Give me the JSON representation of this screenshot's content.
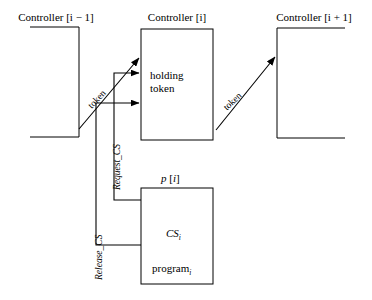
{
  "figure": {
    "background": "#ffffff",
    "stroke": "#000000"
  },
  "controllers": [
    {
      "id": "left",
      "label_prefix": "Controller [",
      "label": "Controller [i − 1]",
      "index_expr": "i − 1"
    },
    {
      "id": "middle",
      "label_prefix": "Controller [",
      "label": "Controller [i]",
      "index_expr": "i"
    },
    {
      "id": "right",
      "label_prefix": "Controller [",
      "label": "Controller [i + 1]",
      "index_expr": "i + 1"
    }
  ],
  "middle_box": {
    "line1": "holding",
    "line2": "token"
  },
  "process_box": {
    "header_name": "p",
    "header": "p [i]",
    "cs_label": "CS",
    "cs_sub": "i",
    "program_label": "program",
    "program_sub": "i"
  },
  "arrows": [
    {
      "name": "token-left-to-middle",
      "label": "token"
    },
    {
      "name": "token-middle-to-right",
      "label": "token"
    },
    {
      "name": "request-cs",
      "label": "Request_CS"
    },
    {
      "name": "release-cs",
      "label": "Release_CS"
    }
  ],
  "edge_labels": {
    "token_left": "token",
    "token_right": "token",
    "request_cs": "Request_CS",
    "release_cs": "Release_CS"
  }
}
